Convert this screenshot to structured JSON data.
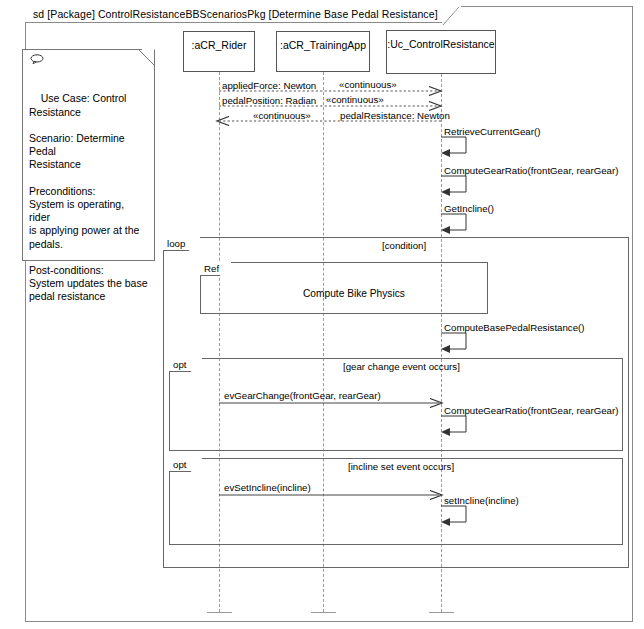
{
  "frame": {
    "title": "sd [Package] ControlResistanceBBScenariosPkg [Determine Base Pedal Resistance]"
  },
  "note": {
    "icon": "note-balloon-icon",
    "text": "Use Case: Control\nResistance\n\nScenario: Determine Pedal\nResistance\n\nPreconditions:\nSystem is operating, rider\nis applying power at the\npedals.\n\nPost-conditions:\nSystem updates the base\npedal resistance"
  },
  "lifelines": [
    {
      "name": ":aCR_Rider"
    },
    {
      "name": ":aCR_TrainingApp"
    },
    {
      "name": ":Uc_ControlResistance"
    }
  ],
  "messages": {
    "applied_force": "appliedForce: Newton",
    "applied_force_stereotype": "«continuous»",
    "pedal_position": "pedalPosition: Radian",
    "pedal_position_stereotype": "«continuous»",
    "pedal_resistance_stereotype": "«continuous»",
    "pedal_resistance": "pedalResistance: Newton",
    "retrieve_current_gear": "RetrieveCurrentGear()",
    "compute_gear_ratio_1": "ComputeGearRatio(frontGear, rearGear)",
    "get_incline": "GetIncline()",
    "compute_base_pedal_resistance": "ComputeBasePedalResistance()",
    "ev_gear_change": "evGearChange(frontGear, rearGear)",
    "compute_gear_ratio_2": "ComputeGearRatio(frontGear, rearGear)",
    "ev_set_incline": "evSetIncline(incline)",
    "set_incline": "setIncline(incline)"
  },
  "fragments": {
    "loop": {
      "operator": "loop",
      "condition": "[condition]"
    },
    "ref": {
      "operator": "Ref",
      "label": "Compute Bike Physics"
    },
    "opt_gear": {
      "operator": "opt",
      "condition": "[gear change event occurs]"
    },
    "opt_incline": {
      "operator": "opt",
      "condition": "[incline set event occurs]"
    }
  },
  "colors": {
    "frame_border": "#8a8a8a",
    "lifeline": "#9a9a9a",
    "text": "#000000",
    "background": "#ffffff"
  }
}
